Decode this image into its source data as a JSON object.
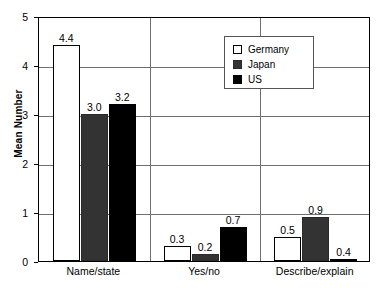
{
  "chart_data": {
    "type": "bar",
    "title": "",
    "xlabel": "",
    "ylabel": "Mean Number",
    "ylim": [
      0,
      5
    ],
    "yticks": [
      "0",
      "1",
      "2",
      "3",
      "4",
      "5"
    ],
    "grid": true,
    "legend_position": "top-right-inside",
    "categories": [
      "Name/state",
      "Yes/no",
      "Describe/explain"
    ],
    "series": [
      {
        "name": "Germany",
        "color": "#ffffff",
        "values": [
          4.4,
          0.3,
          0.5
        ],
        "labels": [
          "4.4",
          "0.3",
          "0.5"
        ]
      },
      {
        "name": "Japan",
        "color": "#333333",
        "values": [
          3.0,
          0.2,
          0.9
        ],
        "labels": [
          "3.0",
          "0.2",
          "0.9"
        ]
      },
      {
        "name": "US",
        "color": "#000000",
        "values": [
          3.2,
          0.7,
          0.4
        ],
        "labels": [
          "3.2",
          "0.7",
          "0.4"
        ]
      }
    ]
  },
  "legend": {
    "entries": [
      {
        "label": "Germany",
        "swatch": "germany"
      },
      {
        "label": "Japan",
        "swatch": "japan"
      },
      {
        "label": "US",
        "swatch": "us"
      }
    ]
  }
}
